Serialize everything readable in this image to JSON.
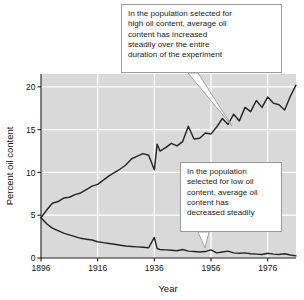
{
  "chart_data": {
    "type": "line",
    "title": "",
    "xlabel": "Year",
    "ylabel": "Percent oil content",
    "xlim": [
      1896,
      1986
    ],
    "ylim": [
      0,
      21.5
    ],
    "xticks": [
      1896,
      1916,
      1936,
      1956,
      1976
    ],
    "yticks": [
      0,
      5,
      10,
      15,
      20
    ],
    "grid": true,
    "legend": "none",
    "plot_background": "#d9d9d9",
    "gridline_color": "#ffffff",
    "line_color": "#262626",
    "series": [
      {
        "name": "Selected for high oil content",
        "x": [
          1896,
          1898,
          1900,
          1902,
          1904,
          1906,
          1908,
          1910,
          1912,
          1914,
          1916,
          1918,
          1920,
          1922,
          1924,
          1926,
          1928,
          1930,
          1932,
          1934,
          1936,
          1937,
          1938,
          1940,
          1942,
          1944,
          1946,
          1948,
          1950,
          1952,
          1954,
          1956,
          1958,
          1960,
          1962,
          1964,
          1966,
          1968,
          1970,
          1972,
          1974,
          1976,
          1978,
          1980,
          1982,
          1984,
          1986
        ],
        "values": [
          4.7,
          5.6,
          6.4,
          6.6,
          7.0,
          7.1,
          7.4,
          7.6,
          8.0,
          8.4,
          8.6,
          9.1,
          9.6,
          10.0,
          10.4,
          10.9,
          11.6,
          11.9,
          12.2,
          12.0,
          10.3,
          13.3,
          12.5,
          12.9,
          13.4,
          13.1,
          13.6,
          15.4,
          13.9,
          14.0,
          14.6,
          14.5,
          15.3,
          16.3,
          15.6,
          16.8,
          16.0,
          17.6,
          17.1,
          18.4,
          17.6,
          18.8,
          18.1,
          17.9,
          17.3,
          18.9,
          20.2
        ]
      },
      {
        "name": "Selected for low oil content",
        "x": [
          1896,
          1898,
          1900,
          1902,
          1904,
          1906,
          1908,
          1910,
          1912,
          1914,
          1916,
          1918,
          1920,
          1922,
          1924,
          1926,
          1928,
          1930,
          1932,
          1934,
          1936,
          1937,
          1938,
          1940,
          1942,
          1944,
          1946,
          1948,
          1950,
          1952,
          1954,
          1956,
          1958,
          1960,
          1962,
          1964,
          1966,
          1968,
          1970,
          1972,
          1974,
          1976,
          1978,
          1980,
          1982,
          1984,
          1986
        ],
        "values": [
          4.7,
          4.0,
          3.5,
          3.2,
          2.9,
          2.7,
          2.5,
          2.3,
          2.2,
          2.1,
          1.9,
          1.8,
          1.7,
          1.6,
          1.5,
          1.4,
          1.35,
          1.3,
          1.25,
          1.2,
          2.4,
          1.1,
          1.0,
          0.95,
          0.9,
          0.85,
          1.0,
          0.8,
          0.75,
          0.7,
          0.75,
          0.95,
          0.6,
          0.7,
          0.8,
          0.6,
          0.55,
          0.6,
          0.5,
          0.45,
          0.4,
          0.55,
          0.45,
          0.4,
          0.5,
          0.35,
          0.25
        ]
      }
    ],
    "annotations": [
      {
        "id": "callout-high",
        "target_series": "Selected for high oil content",
        "lines": [
          "In the population selected for",
          "high oil content, average oil",
          "content has increased",
          "steadily over the entire",
          "duration of the experiment"
        ]
      },
      {
        "id": "callout-low",
        "target_series": "Selected for low oil content",
        "lines": [
          "In the population",
          "selected for low oil",
          "content, average oil",
          "content has",
          "decreased steadily"
        ]
      }
    ]
  }
}
